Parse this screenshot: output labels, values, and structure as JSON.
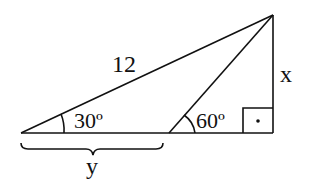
{
  "diagram": {
    "type": "geometry-triangle",
    "hypotenuse_label": "12",
    "vertical_side_label": "x",
    "base_segment_label": "y",
    "angle_left": "30º",
    "angle_middle": "60º",
    "right_angle_marker": "•",
    "colors": {
      "stroke": "#111111",
      "background": "#ffffff"
    }
  }
}
